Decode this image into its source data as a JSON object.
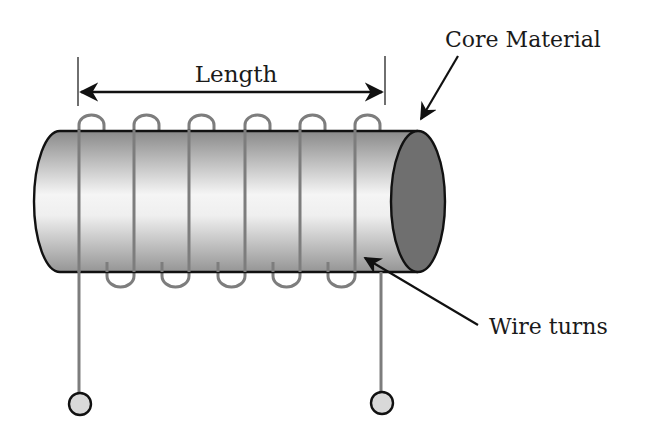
{
  "diagram": {
    "labels": {
      "length": "Length",
      "core_material": "Core Material",
      "wire_turns": "Wire turns"
    },
    "colors": {
      "background": "#ffffff",
      "outline": "#111111",
      "wire": "#7d7d7d",
      "core_body_edge": "#8c8c8c",
      "core_body_highlight": "#f7f7f7",
      "core_end_face": "#6f6f6f",
      "terminal_fill": "#d9d9d9",
      "text": "#1a1a1a"
    },
    "coil": {
      "turns": 6,
      "front_wire_x": [
        79,
        134,
        189,
        245,
        300,
        355
      ],
      "lead_left_x": 79,
      "lead_right_x": 381
    },
    "terminals": [
      {
        "name": "left-terminal",
        "cx": 80,
        "cy": 404
      },
      {
        "name": "right-terminal",
        "cx": 382,
        "cy": 403
      }
    ]
  }
}
